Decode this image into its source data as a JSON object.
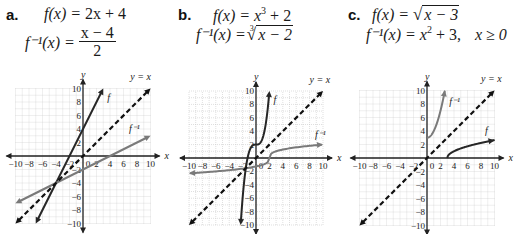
{
  "panels": [
    {
      "label": "a.",
      "f_lhs": "f(x) = ",
      "f_rhs": "2x + 4",
      "inv_lhs": "f⁻¹(x) = ",
      "inv_num": "x − 4",
      "inv_den": "2"
    },
    {
      "label": "b.",
      "f_lhs": "f(x) = ",
      "f_rhs_base": "x",
      "f_rhs_exp": "3",
      "f_rhs_tail": " + 2",
      "inv_lhs": "f⁻¹(x) = ",
      "inv_index": "3",
      "inv_radicand": "x − 2"
    },
    {
      "label": "c.",
      "f_lhs": "f(x) = ",
      "f_radicand": "x − 3",
      "inv_lhs": "f⁻¹(x) = ",
      "inv_base": "x",
      "inv_exp": "2",
      "inv_tail": " + 3,",
      "inv_domain": "x ≥ 0"
    }
  ],
  "chart_data": [
    {
      "type": "line",
      "title": "a. f(x) = 2x + 4, f⁻¹(x) = (x − 4)/2",
      "xlabel": "x",
      "ylabel": "y",
      "xlim": [
        -10,
        10
      ],
      "ylim": [
        -10,
        10
      ],
      "xticks": [
        -10,
        -8,
        -6,
        -4,
        -2,
        0,
        2,
        4,
        6,
        8,
        10
      ],
      "yticks": [
        -10,
        -8,
        -6,
        -4,
        -2,
        2,
        4,
        6,
        8,
        10
      ],
      "grid": true,
      "origin_px": [
        83,
        156
      ],
      "scale_px": 6.75,
      "series": [
        {
          "name": "f",
          "label": "f",
          "style": "solid",
          "color": "#262626",
          "arrows": "both",
          "points": [
            [
              -7,
              -10
            ],
            [
              3,
              10
            ]
          ],
          "label_at": [
            3.6,
            8.2
          ]
        },
        {
          "name": "f^-1",
          "label": "f⁻¹",
          "style": "solid",
          "color": "#7a7a7a",
          "arrows": "both",
          "points": [
            [
              -10,
              -7
            ],
            [
              10,
              3
            ]
          ],
          "label_at": [
            6.8,
            3.6
          ]
        },
        {
          "name": "y = x",
          "label": "y = x",
          "style": "dashed",
          "color": "#111111",
          "arrows": "both",
          "points": [
            [
              -10,
              -10
            ],
            [
              10,
              10
            ]
          ],
          "label_at": [
            7.0,
            11.2
          ]
        }
      ]
    },
    {
      "type": "line",
      "title": "b. f(x) = x³ + 2, f⁻¹(x) = ∛(x − 2)",
      "xlabel": "x",
      "ylabel": "y",
      "xlim": [
        -10,
        10
      ],
      "ylim": [
        -10,
        10
      ],
      "xticks": [
        -10,
        -8,
        -6,
        -4,
        -2,
        0,
        2,
        4,
        6,
        8,
        10
      ],
      "yticks": [
        -10,
        -8,
        -6,
        -4,
        -2,
        2,
        4,
        6,
        8,
        10
      ],
      "grid": true,
      "origin_px": [
        256,
        158
      ],
      "scale_px": 6.7,
      "series": [
        {
          "name": "f",
          "label": "f",
          "style": "solid",
          "color": "#262626",
          "arrows": "both",
          "function": "x^3 + 2",
          "domain": [
            -2.289,
            2.0
          ],
          "label_at": [
            2.6,
            8.2
          ]
        },
        {
          "name": "f^-1",
          "label": "f⁻¹",
          "style": "solid",
          "color": "#7a7a7a",
          "arrows": "both",
          "function": "cbrt(x - 2)",
          "domain": [
            -10,
            10
          ],
          "label_at": [
            8.8,
            3.0
          ]
        },
        {
          "name": "y = x",
          "label": "y = x",
          "style": "dashed",
          "color": "#111111",
          "arrows": "both",
          "points": [
            [
              -10,
              -10
            ],
            [
              10,
              10
            ]
          ],
          "label_at": [
            8.0,
            11.2
          ]
        }
      ]
    },
    {
      "type": "line",
      "title": "c. f(x) = √(x − 3), f⁻¹(x) = x² + 3, x ≥ 0",
      "xlabel": "x",
      "ylabel": "y",
      "xlim": [
        -10,
        10
      ],
      "ylim": [
        -10,
        10
      ],
      "xticks": [
        -10,
        -8,
        -6,
        -4,
        -2,
        0,
        2,
        4,
        6,
        8,
        10
      ],
      "yticks": [
        -10,
        -8,
        -6,
        -4,
        -2,
        2,
        4,
        6,
        8,
        10
      ],
      "grid": true,
      "origin_px": [
        427,
        158
      ],
      "scale_px": 6.75,
      "series": [
        {
          "name": "f",
          "label": "f",
          "style": "solid",
          "color": "#262626",
          "arrows": "end",
          "function": "sqrt(x - 3)",
          "domain": [
            3,
            10
          ],
          "label_at": [
            8.6,
            3.6
          ]
        },
        {
          "name": "f^-1",
          "label": "f⁻¹",
          "style": "solid",
          "color": "#7a7a7a",
          "arrows": "end",
          "function": "x^2 + 3",
          "domain": [
            0,
            2.65
          ],
          "label_at": [
            3.3,
            7.8
          ]
        },
        {
          "name": "y = x",
          "label": "y = x",
          "style": "dashed",
          "color": "#111111",
          "arrows": "both",
          "points": [
            [
              -10,
              -10
            ],
            [
              10,
              10
            ]
          ],
          "label_at": [
            8.0,
            11.2
          ]
        }
      ]
    }
  ]
}
